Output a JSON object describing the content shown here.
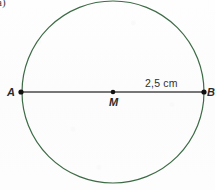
{
  "figure": {
    "item_marker": "a)",
    "background_color": "#fdfdfd",
    "width": 215,
    "height": 190
  },
  "circle": {
    "name": "circle",
    "stroke_color": "#3d6b46",
    "stroke_width": 1.2,
    "center_x": 113,
    "center_y": 92,
    "radius": 91
  },
  "diameter": {
    "name": "segment-AB",
    "stroke_color": "#4a4a4a",
    "stroke_width": 1.6,
    "x1": 21,
    "y1": 92,
    "x2": 204,
    "y2": 92
  },
  "points": [
    {
      "id": "A",
      "label": "A",
      "x": 21,
      "y": 92,
      "dot_color": "#111111",
      "dot_radius": 2.6
    },
    {
      "id": "M",
      "label": "M",
      "x": 113,
      "y": 92,
      "dot_color": "#111111",
      "dot_radius": 2.3
    },
    {
      "id": "B",
      "label": "B",
      "x": 204,
      "y": 92,
      "dot_color": "#111111",
      "dot_radius": 2.6
    }
  ],
  "measurement": {
    "label": "2,5 cm",
    "value": "2,5",
    "unit": "cm",
    "describes": "radius-MB"
  }
}
